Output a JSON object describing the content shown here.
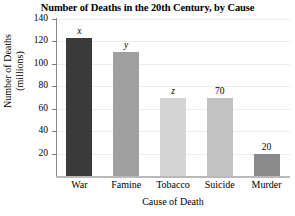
{
  "chart_data": {
    "type": "bar",
    "title": "Number of Deaths in the 20th Century, by Cause",
    "xlabel": "Cause of Death",
    "ylabel": "Number of Deaths (millions)",
    "ylabel_line1": "Number of Deaths",
    "ylabel_line2": "(millions)",
    "categories": [
      "War",
      "Famine",
      "Tobacco",
      "Suicide",
      "Murder"
    ],
    "values": [
      123,
      111,
      70,
      70,
      20
    ],
    "point_labels": [
      "x",
      "y",
      "z",
      "70",
      "20"
    ],
    "point_label_styles": [
      "italic",
      "italic",
      "italic",
      "normal",
      "normal"
    ],
    "bar_colors": [
      "#3a3a3a",
      "#a0a0a0",
      "#d4d4d4",
      "#c2c2c2",
      "#8a8a8a"
    ],
    "ylim": [
      0,
      140
    ],
    "ytick_values": [
      20,
      40,
      60,
      80,
      100,
      120,
      140
    ],
    "ytick_labels": [
      "20",
      "40",
      "60",
      "80",
      "100",
      "120",
      "140"
    ],
    "grid": true,
    "grid_color": "#ececec",
    "legend": "none",
    "background": "#ffffff"
  }
}
